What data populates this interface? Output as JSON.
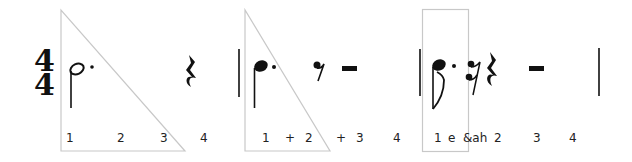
{
  "time_signature": {
    "top": "4",
    "bottom": "4"
  },
  "colors": {
    "highlight_outline": "#c8c8c8",
    "ink": "#111111"
  },
  "measures": [
    {
      "index": 1,
      "rhythm": [
        "dotted-half-note",
        "quarter-rest"
      ],
      "highlight": "triangle",
      "counts": [
        {
          "label": "1",
          "x": 66
        },
        {
          "label": "2",
          "x": 117
        },
        {
          "label": "3",
          "x": 160
        },
        {
          "label": "4",
          "x": 200
        }
      ]
    },
    {
      "index": 2,
      "rhythm": [
        "dotted-quarter-note",
        "eighth-rest",
        "half-rest"
      ],
      "highlight": "triangle",
      "counts": [
        {
          "label": "1",
          "x": 262
        },
        {
          "label": "+",
          "x": 285
        },
        {
          "label": "2",
          "x": 305
        },
        {
          "label": "+",
          "x": 336
        },
        {
          "label": "3",
          "x": 356
        },
        {
          "label": "4",
          "x": 393
        }
      ]
    },
    {
      "index": 3,
      "rhythm": [
        "dotted-eighth-note",
        "sixteenth-rest",
        "quarter-rest",
        "half-rest"
      ],
      "highlight": "rectangle",
      "counts": [
        {
          "label": "1",
          "x": 436
        },
        {
          "label": "e",
          "x": 449
        },
        {
          "label": "&ah",
          "x": 473
        },
        {
          "label": "2",
          "x": 497
        },
        {
          "label": "3",
          "x": 535
        },
        {
          "label": "4",
          "x": 571
        }
      ]
    }
  ]
}
